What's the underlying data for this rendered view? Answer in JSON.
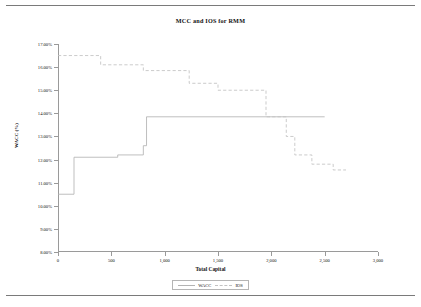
{
  "chart_data": {
    "type": "line",
    "title": "MCC and IOS for RMM",
    "xlabel": "Total Capital",
    "ylabel": "WACC (%)",
    "xlim": [
      0,
      3000
    ],
    "ylim": [
      8,
      17
    ],
    "grid": false,
    "legend_position": "bottom",
    "xticks": [
      0,
      500,
      1000,
      1500,
      2000,
      2500,
      3000
    ],
    "xticklabels": [
      "0",
      "500",
      "1,000",
      "1,500",
      "2,000",
      "2,500",
      "3,000"
    ],
    "yticks": [
      8,
      9,
      10,
      11,
      12,
      13,
      14,
      15,
      16,
      17
    ],
    "yticklabels": [
      "8.00%",
      "9.00%",
      "10.00%",
      "11.00%",
      "12.00%",
      "13.00%",
      "14.00%",
      "15.00%",
      "16.00%",
      "17.00%"
    ],
    "series": [
      {
        "name": "WACC",
        "style": "solid",
        "color": "#b3b3b3",
        "step": "post",
        "points": [
          [
            0,
            10.5
          ],
          [
            150,
            10.5
          ],
          [
            150,
            12.1
          ],
          [
            560,
            12.1
          ],
          [
            560,
            12.2
          ],
          [
            800,
            12.2
          ],
          [
            800,
            12.6
          ],
          [
            830,
            12.6
          ],
          [
            830,
            13.85
          ],
          [
            2500,
            13.85
          ]
        ]
      },
      {
        "name": "IOS",
        "style": "dashed",
        "color": "#c2c2c2",
        "step": "post",
        "points": [
          [
            0,
            16.5
          ],
          [
            400,
            16.5
          ],
          [
            400,
            16.1
          ],
          [
            800,
            16.1
          ],
          [
            800,
            15.85
          ],
          [
            1230,
            15.85
          ],
          [
            1230,
            15.3
          ],
          [
            1500,
            15.3
          ],
          [
            1500,
            15.0
          ],
          [
            1950,
            15.0
          ],
          [
            1950,
            13.85
          ],
          [
            2140,
            13.85
          ],
          [
            2140,
            13.0
          ],
          [
            2220,
            13.0
          ],
          [
            2220,
            12.2
          ],
          [
            2380,
            12.2
          ],
          [
            2380,
            11.8
          ],
          [
            2580,
            11.8
          ],
          [
            2580,
            11.55
          ],
          [
            2700,
            11.55
          ]
        ]
      }
    ]
  },
  "legend": {
    "items": [
      {
        "label": "WACC",
        "style": "solid"
      },
      {
        "label": "IOS",
        "style": "dashed"
      }
    ]
  }
}
